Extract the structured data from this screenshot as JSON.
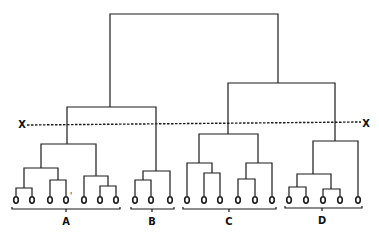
{
  "diagram": {
    "type": "dendrogram",
    "cut_line": {
      "label_left": "X",
      "label_right": "X",
      "style": "dashed"
    },
    "leaf_symbol": "o",
    "leaf_mark": "'",
    "clusters": [
      {
        "label": "A",
        "leaf_count": 7
      },
      {
        "label": "B",
        "leaf_count": 3
      },
      {
        "label": "C",
        "leaf_count": 6
      },
      {
        "label": "D",
        "leaf_count": 5
      }
    ]
  },
  "geometry": {
    "line_color": "#1a1a1a",
    "leaf_y": 200,
    "leaves_x": [
      16,
      32,
      50,
      66,
      84,
      100,
      116,
      135,
      151,
      170,
      187,
      204,
      220,
      238,
      255,
      272,
      289,
      306,
      323,
      340,
      358
    ],
    "links": [
      {
        "x1": 16,
        "x2": 32,
        "y": 188,
        "y1": 200,
        "y2": 200
      },
      {
        "x1": 50,
        "x2": 66,
        "y": 180,
        "y1": 200,
        "y2": 200
      },
      {
        "x1": 24,
        "x2": 58,
        "y": 168,
        "y1": 188,
        "y2": 180
      },
      {
        "x1": 100,
        "x2": 116,
        "y": 186,
        "y1": 200,
        "y2": 200
      },
      {
        "x1": 84,
        "x2": 108,
        "y": 176,
        "y1": 200,
        "y2": 186
      },
      {
        "x1": 41,
        "x2": 96,
        "y": 144,
        "y1": 168,
        "y2": 176
      },
      {
        "x1": 135,
        "x2": 151,
        "y": 180,
        "y1": 200,
        "y2": 200
      },
      {
        "x1": 143,
        "x2": 170,
        "y": 171,
        "y1": 180,
        "y2": 200
      },
      {
        "x1": 67,
        "x2": 156,
        "y": 107,
        "y1": 144,
        "y2": 171
      },
      {
        "x1": 204,
        "x2": 220,
        "y": 173,
        "y1": 200,
        "y2": 200
      },
      {
        "x1": 187,
        "x2": 212,
        "y": 163,
        "y1": 200,
        "y2": 173
      },
      {
        "x1": 238,
        "x2": 255,
        "y": 179,
        "y1": 200,
        "y2": 200
      },
      {
        "x1": 246,
        "x2": 272,
        "y": 163,
        "y1": 179,
        "y2": 200
      },
      {
        "x1": 199,
        "x2": 258,
        "y": 134,
        "y1": 163,
        "y2": 163
      },
      {
        "x1": 289,
        "x2": 306,
        "y": 187,
        "y1": 200,
        "y2": 200
      },
      {
        "x1": 323,
        "x2": 340,
        "y": 189,
        "y1": 200,
        "y2": 200
      },
      {
        "x1": 297,
        "x2": 331,
        "y": 174,
        "y1": 187,
        "y2": 189
      },
      {
        "x1": 313,
        "x2": 358,
        "y": 141,
        "y1": 174,
        "y2": 200
      },
      {
        "x1": 228,
        "x2": 335,
        "y": 83,
        "y1": 134,
        "y2": 141
      },
      {
        "x1": 110,
        "x2": 278,
        "y": 14,
        "y1": 107,
        "y2": 83
      }
    ],
    "cut": {
      "x1": 27,
      "y1": 125,
      "x2": 361,
      "y2": 122,
      "lx": 22,
      "ly": 124,
      "rx": 366,
      "ry": 123
    },
    "brackets": [
      {
        "x1": 12,
        "x2": 120,
        "y": 209,
        "tick_x": 66,
        "label_y": 221
      },
      {
        "x1": 131,
        "x2": 174,
        "y": 209,
        "tick_x": 152,
        "label_y": 221
      },
      {
        "x1": 183,
        "x2": 276,
        "y": 209,
        "tick_x": 229,
        "label_y": 221
      },
      {
        "x1": 285,
        "x2": 362,
        "y": 208,
        "tick_x": 322,
        "label_y": 220
      }
    ],
    "mark_pos": {
      "x": 71,
      "y": 196
    }
  }
}
